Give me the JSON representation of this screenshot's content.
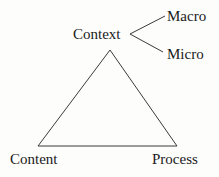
{
  "diagram": {
    "type": "triangle-with-branch",
    "nodes": {
      "apex": {
        "label": "Context"
      },
      "bottom_left": {
        "label": "Content"
      },
      "bottom_right": {
        "label": "Process"
      }
    },
    "branches": {
      "from": "Context",
      "items": [
        {
          "label": "Macro"
        },
        {
          "label": "Micro"
        }
      ]
    },
    "edges": [
      {
        "from": "Context",
        "to": "Content"
      },
      {
        "from": "Context",
        "to": "Process"
      },
      {
        "from": "Content",
        "to": "Process"
      },
      {
        "from": "Context",
        "to": "Macro"
      },
      {
        "from": "Context",
        "to": "Micro"
      }
    ],
    "colors": {
      "line": "#3a3a3a",
      "text": "#1a1a1a",
      "background": "#fdfdfc"
    }
  }
}
